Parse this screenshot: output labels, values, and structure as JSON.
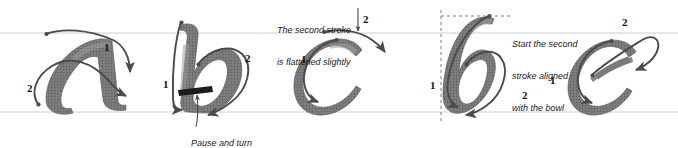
{
  "diagram": {
    "background": "#ffffff",
    "guide_line_color": "#b9b9b9",
    "stroke_arrow_color": "#4a4a4a",
    "letter_fill": "#6e6e6e",
    "text_color": "#1a1a1a",
    "glyphs": [
      {
        "id": "glyph-a",
        "letter": "a",
        "stroke_numbers": [
          "1",
          "2"
        ],
        "notes": []
      },
      {
        "id": "glyph-b",
        "letter": "b",
        "stroke_numbers": [
          "1",
          "2"
        ],
        "notes": [
          "Pause and turn"
        ]
      },
      {
        "id": "glyph-c",
        "letter": "c",
        "stroke_numbers": [
          "1",
          "2"
        ],
        "notes": [
          "The second stroke",
          "is flattened slightly"
        ]
      },
      {
        "id": "glyph-d",
        "letter": "d",
        "stroke_numbers": [
          "1",
          "2"
        ],
        "notes": [
          "Start the second",
          "stroke aligned",
          "with the bowl"
        ]
      },
      {
        "id": "glyph-e",
        "letter": "e",
        "stroke_numbers": [
          "1",
          "2"
        ],
        "notes": []
      }
    ],
    "annotations": [
      {
        "id": "note-pause-and-turn",
        "text": "Pause and turn",
        "italic": true,
        "x": 181,
        "y": 131,
        "font_size": 9
      },
      {
        "id": "note-second-stroke-flattened",
        "line1": "The second stroke",
        "line2": "is flattened slightly",
        "italic": true,
        "x": 277,
        "y": 5,
        "font_size": 9
      },
      {
        "id": "note-start-second-stroke",
        "line1": "Start the second",
        "line2": "stroke aligned",
        "line3": "with the bowl",
        "italic": true,
        "x": 512,
        "y": 20,
        "font_size": 9
      }
    ],
    "stroke_labels": [
      {
        "id": "label-a-1",
        "text": "1",
        "x": 104,
        "y": 47
      },
      {
        "id": "label-a-2",
        "text": "2",
        "x": 29,
        "y": 88
      },
      {
        "id": "label-b-1",
        "text": "1",
        "x": 164,
        "y": 84
      },
      {
        "id": "label-b-2",
        "text": "2",
        "x": 246,
        "y": 58
      },
      {
        "id": "label-c-1",
        "text": "1",
        "x": 302,
        "y": 59
      },
      {
        "id": "label-c-2",
        "text": "2",
        "x": 364,
        "y": 19
      },
      {
        "id": "label-d-1",
        "text": "1",
        "x": 431,
        "y": 85
      },
      {
        "id": "label-d-2",
        "text": "2",
        "x": 523,
        "y": 95
      },
      {
        "id": "label-e-1",
        "text": "1",
        "x": 551,
        "y": 80
      },
      {
        "id": "label-e-2",
        "text": "2",
        "x": 623,
        "y": 22
      }
    ]
  }
}
